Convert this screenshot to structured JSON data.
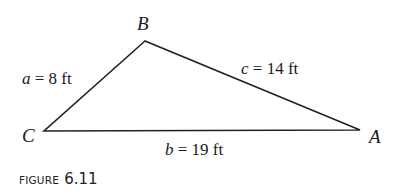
{
  "figure": {
    "caption_prefix": "FIGURE",
    "caption_number": "6.11"
  },
  "triangle": {
    "vertices": [
      {
        "name": "B",
        "x": 145,
        "y": 41
      },
      {
        "name": "C",
        "x": 44,
        "y": 131
      },
      {
        "name": "A",
        "x": 360,
        "y": 130
      }
    ],
    "sides": [
      {
        "var": "a",
        "eq": " = 8 ft",
        "between": "B-C"
      },
      {
        "var": "c",
        "eq": " = 14 ft",
        "between": "B-A"
      },
      {
        "var": "b",
        "eq": " = 19 ft",
        "between": "C-A"
      }
    ],
    "stroke_color": "#222222"
  }
}
